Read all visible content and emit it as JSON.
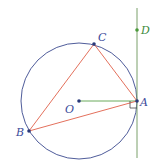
{
  "diagram": {
    "colors": {
      "circle": "#3b4a8f",
      "triangle": "#e0604a",
      "radius": "#5aa04a",
      "tangent": "#7aa06a",
      "points": "#2a3a7a",
      "point_d": "#4a9a3a",
      "label_blue": "#3a4a9a",
      "label_green": "#3a8a3a"
    },
    "circle": {
      "center": "O",
      "cx": 79,
      "cy": 101,
      "r": 58
    },
    "points": [
      {
        "id": "A",
        "label": "A",
        "x": 137,
        "y": 101
      },
      {
        "id": "B",
        "label": "B",
        "x": 29,
        "y": 131
      },
      {
        "id": "C",
        "label": "C",
        "x": 94,
        "y": 44
      },
      {
        "id": "O",
        "label": "O",
        "x": 79,
        "y": 101
      },
      {
        "id": "D",
        "label": "D",
        "x": 137,
        "y": 30
      }
    ],
    "segments": [
      {
        "from": "A",
        "to": "B",
        "kind": "triangle-side"
      },
      {
        "from": "B",
        "to": "C",
        "kind": "triangle-side"
      },
      {
        "from": "C",
        "to": "A",
        "kind": "triangle-side"
      },
      {
        "from": "O",
        "to": "A",
        "kind": "radius"
      }
    ],
    "tangent_line": {
      "through": [
        "A",
        "D"
      ],
      "x": 137,
      "y1": 8,
      "y2": 158
    },
    "right_angle_marker": {
      "at": "A",
      "between": [
        "OA",
        "tangent"
      ]
    },
    "labels": {
      "A": "A",
      "B": "B",
      "C": "C",
      "D": "D",
      "O": "O"
    }
  }
}
